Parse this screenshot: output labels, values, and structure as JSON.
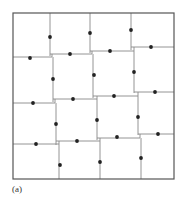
{
  "figure": {
    "label": "(a)",
    "colors": {
      "frame": "#555555",
      "edge": "#888888",
      "dot": "#222222"
    }
  }
}
